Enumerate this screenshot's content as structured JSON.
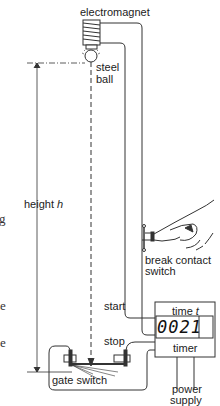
{
  "diagram": {
    "labels": {
      "electromagnet": "electromagnet",
      "steel_ball_line1": "steel",
      "steel_ball_line2": "ball",
      "height": "height ",
      "height_var": "h",
      "break_contact_line1": "break contact",
      "break_contact_line2": "switch",
      "start": "start",
      "stop": "stop",
      "time": "time ",
      "time_var": "t",
      "timer": "timer",
      "gate_switch": "gate switch",
      "power_line1": "power",
      "power_line2": "supply"
    },
    "timer_display": "0021",
    "clipped_left_text": [
      "g",
      "e",
      "e"
    ],
    "colors": {
      "line": "#333333",
      "background": "#ffffff"
    }
  }
}
